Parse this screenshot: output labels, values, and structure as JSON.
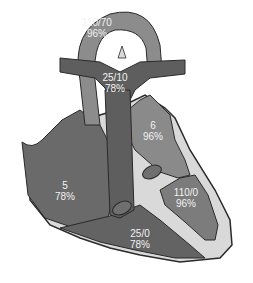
{
  "colors": {
    "background": "#ffffff",
    "aorta": "#8c8c8c",
    "pulmonary_artery": "#5e5e5e",
    "right_atrium": "#6a6a6a",
    "right_ventricle": "#636363",
    "left_atrium": "#8a8a8a",
    "left_ventricle": "#7c7c7c",
    "myocardium": "#d9d9d9",
    "outline": "#2a2a2a",
    "label_text": "#f2f2f2"
  },
  "chambers": {
    "aorta": {
      "pressure": "110/70",
      "saturation": "96%"
    },
    "pulmonary_artery": {
      "pressure": "25/10",
      "saturation": "78%"
    },
    "left_atrium": {
      "pressure": "6",
      "saturation": "96%"
    },
    "right_atrium": {
      "pressure": "5",
      "saturation": "78%"
    },
    "left_ventricle": {
      "pressure": "110/0",
      "saturation": "96%"
    },
    "right_ventricle": {
      "pressure": "25/0",
      "saturation": "78%"
    }
  }
}
